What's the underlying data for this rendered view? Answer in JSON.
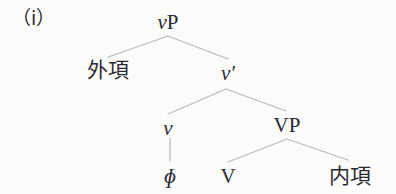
{
  "figure": {
    "example_label": "（i）",
    "caption": "",
    "background_color": "#fbfbf9",
    "text_color": "#2a2a32",
    "line_color": "#b8b8bd"
  },
  "tree": {
    "type": "syntax-tree",
    "nodes": [
      {
        "id": "vP",
        "label": "vP",
        "label_head": "v",
        "label_tail": "P",
        "style": "italic-head",
        "x": 168,
        "y": 22
      },
      {
        "id": "ext_arg",
        "label": "外項",
        "style": "cjk",
        "x": 108,
        "y": 70
      },
      {
        "id": "vbar",
        "label": "v′",
        "label_head": "v",
        "label_tail": "′",
        "style": "italic-head",
        "x": 228,
        "y": 73
      },
      {
        "id": "v",
        "label": "v",
        "style": "italic",
        "x": 168,
        "y": 128
      },
      {
        "id": "VP",
        "label": "VP",
        "style": "upright",
        "x": 287,
        "y": 125
      },
      {
        "id": "phi",
        "label": "ɸ",
        "style": "italic",
        "x": 170,
        "y": 176
      },
      {
        "id": "V",
        "label": "V",
        "style": "upright",
        "x": 228,
        "y": 176
      },
      {
        "id": "int_arg",
        "label": "内項",
        "style": "cjk",
        "x": 350,
        "y": 176
      }
    ],
    "edges": [
      {
        "from": "vP",
        "to": "ext_arg",
        "x1": 168,
        "y1": 36,
        "x2": 108,
        "y2": 57
      },
      {
        "from": "vP",
        "to": "vbar",
        "x1": 168,
        "y1": 36,
        "x2": 228,
        "y2": 59
      },
      {
        "from": "vbar",
        "to": "v",
        "x1": 226,
        "y1": 89,
        "x2": 168,
        "y2": 114
      },
      {
        "from": "vbar",
        "to": "VP",
        "x1": 226,
        "y1": 89,
        "x2": 286,
        "y2": 111
      },
      {
        "from": "v",
        "to": "phi",
        "x1": 170,
        "y1": 138,
        "x2": 170,
        "y2": 161
      },
      {
        "from": "VP",
        "to": "V",
        "x1": 287,
        "y1": 139,
        "x2": 228,
        "y2": 162
      },
      {
        "from": "VP",
        "to": "int_arg",
        "x1": 287,
        "y1": 139,
        "x2": 348,
        "y2": 160
      }
    ]
  }
}
